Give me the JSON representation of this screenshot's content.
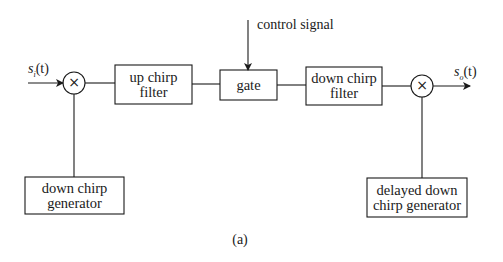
{
  "diagram": {
    "input_signal": {
      "base": "s",
      "sub": "i",
      "arg": "(t)"
    },
    "output_signal": {
      "base": "s",
      "sub": "o",
      "arg": "(t)"
    },
    "control_label": "control signal",
    "blocks": {
      "up_chirp_filter": [
        "up chirp",
        "filter"
      ],
      "gate": [
        "gate"
      ],
      "down_chirp_filter": [
        "down chirp",
        "filter"
      ],
      "down_chirp_generator": [
        "down chirp",
        "generator"
      ],
      "delayed_down_chirp_generator": [
        "delayed down",
        "chirp generator"
      ]
    },
    "multiplier_symbol": "×",
    "caption": "(a)",
    "line_color": "#1a1a1a"
  }
}
